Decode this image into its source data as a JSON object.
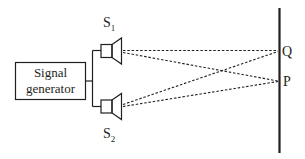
{
  "diagram": {
    "generator": {
      "line1": "Signal",
      "line2": "generator"
    },
    "sources": [
      {
        "label": "S",
        "subscript": "1"
      },
      {
        "label": "S",
        "subscript": "2"
      }
    ],
    "points": [
      {
        "label": "Q"
      },
      {
        "label": "P"
      }
    ],
    "colors": {
      "stroke": "#231f20",
      "background": "#ffffff"
    }
  }
}
